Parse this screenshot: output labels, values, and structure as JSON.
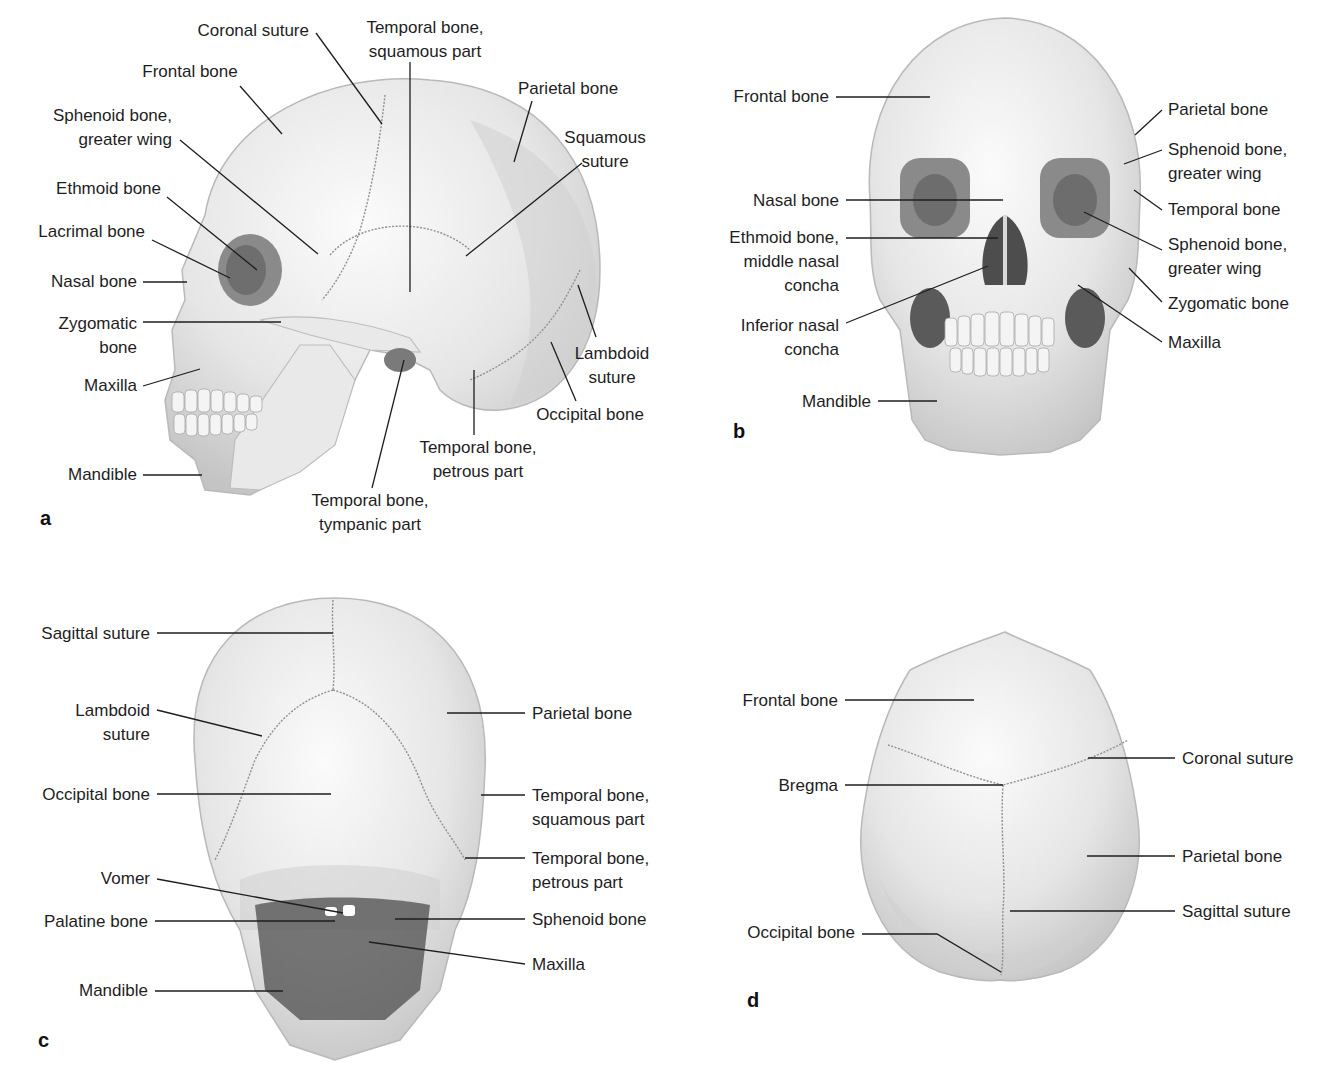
{
  "figure": {
    "panels": [
      {
        "id": "a",
        "letter": "a",
        "view": "lateral",
        "letter_pos": [
          40,
          525
        ],
        "labels": [
          {
            "text": [
              "Coronal suture"
            ],
            "x": 309,
            "y": 36,
            "anchor": "end",
            "line": [
              [
                316,
                33
              ],
              [
                382,
                124
              ]
            ]
          },
          {
            "text": [
              "Temporal bone,",
              "squamous part"
            ],
            "x": 425,
            "y": 33,
            "anchor": "middle",
            "line": [
              [
                410,
                62
              ],
              [
                410,
                292
              ]
            ]
          },
          {
            "text": [
              "Frontal bone"
            ],
            "x": 190,
            "y": 77,
            "anchor": "middle",
            "line": [
              [
                240,
                86
              ],
              [
                282,
                134
              ]
            ]
          },
          {
            "text": [
              "Parietal bone"
            ],
            "x": 568,
            "y": 94,
            "anchor": "middle",
            "line": [
              [
                532,
                101
              ],
              [
                514,
                162
              ]
            ]
          },
          {
            "text": [
              "Sphenoid bone,",
              "greater wing"
            ],
            "x": 172,
            "y": 121,
            "anchor": "end",
            "line": [
              [
                180,
                140
              ],
              [
                318,
                254
              ]
            ]
          },
          {
            "text": [
              "Squamous",
              "suture"
            ],
            "x": 605,
            "y": 143,
            "anchor": "middle",
            "line": [
              [
                582,
                163
              ],
              [
                466,
                256
              ]
            ]
          },
          {
            "text": [
              "Ethmoid bone"
            ],
            "x": 161,
            "y": 194,
            "anchor": "end",
            "line": [
              [
                167,
                197
              ],
              [
                257,
                270
              ]
            ]
          },
          {
            "text": [
              "Lacrimal bone"
            ],
            "x": 145,
            "y": 237,
            "anchor": "end",
            "line": [
              [
                152,
                240
              ],
              [
                230,
                278
              ]
            ]
          },
          {
            "text": [
              "Nasal bone"
            ],
            "x": 137,
            "y": 287,
            "anchor": "end",
            "line": [
              [
                143,
                282
              ],
              [
                187,
                282
              ]
            ]
          },
          {
            "text": [
              "Zygomatic",
              "bone"
            ],
            "x": 137,
            "y": 329,
            "anchor": "end",
            "line": [
              [
                143,
                322
              ],
              [
                281,
                322
              ]
            ]
          },
          {
            "text": [
              "Lambdoid",
              "suture"
            ],
            "x": 612,
            "y": 359,
            "anchor": "middle",
            "line": [
              [
                596,
                337
              ],
              [
                578,
                285
              ]
            ]
          },
          {
            "text": [
              "Maxilla"
            ],
            "x": 137,
            "y": 391,
            "anchor": "end",
            "line": [
              [
                143,
                386
              ],
              [
                200,
                369
              ]
            ]
          },
          {
            "text": [
              "Occipital bone"
            ],
            "x": 590,
            "y": 420,
            "anchor": "middle",
            "line": [
              [
                576,
                401
              ],
              [
                551,
                342
              ]
            ]
          },
          {
            "text": [
              "Temporal bone,",
              "petrous part"
            ],
            "x": 478,
            "y": 453,
            "anchor": "middle",
            "line": [
              [
                474,
                435
              ],
              [
                474,
                370
              ]
            ]
          },
          {
            "text": [
              "Mandible"
            ],
            "x": 137,
            "y": 480,
            "anchor": "end",
            "line": [
              [
                143,
                475
              ],
              [
                202,
                475
              ]
            ]
          },
          {
            "text": [
              "Temporal bone,",
              "tympanic part"
            ],
            "x": 370,
            "y": 506,
            "anchor": "middle",
            "line": [
              [
                372,
                488
              ],
              [
                404,
                360
              ]
            ]
          }
        ]
      },
      {
        "id": "b",
        "letter": "b",
        "view": "anterior",
        "letter_pos": [
          733,
          438
        ],
        "labels": [
          {
            "text": [
              "Frontal bone"
            ],
            "x": 829,
            "y": 102,
            "anchor": "end",
            "line": [
              [
                836,
                97
              ],
              [
                930,
                97
              ]
            ]
          },
          {
            "text": [
              "Parietal bone"
            ],
            "x": 1168,
            "y": 115,
            "anchor": "start",
            "line": [
              [
                1162,
                110
              ],
              [
                1135,
                135
              ]
            ]
          },
          {
            "text": [
              "Sphenoid bone,",
              "greater wing"
            ],
            "x": 1168,
            "y": 155,
            "anchor": "start",
            "line": [
              [
                1162,
                150
              ],
              [
                1124,
                164
              ]
            ]
          },
          {
            "text": [
              "Nasal bone"
            ],
            "x": 839,
            "y": 206,
            "anchor": "end",
            "line": [
              [
                846,
                200
              ],
              [
                1003,
                200
              ]
            ]
          },
          {
            "text": [
              "Temporal bone"
            ],
            "x": 1168,
            "y": 215,
            "anchor": "start",
            "line": [
              [
                1162,
                210
              ],
              [
                1134,
                190
              ]
            ]
          },
          {
            "text": [
              "Ethmoid bone,",
              "middle nasal",
              "concha"
            ],
            "x": 839,
            "y": 243,
            "anchor": "end",
            "line": [
              [
                846,
                238
              ],
              [
                998,
                238
              ]
            ]
          },
          {
            "text": [
              "Sphenoid bone,",
              "greater wing"
            ],
            "x": 1168,
            "y": 250,
            "anchor": "start",
            "line": [
              [
                1162,
                250
              ],
              [
                1084,
                212
              ]
            ]
          },
          {
            "text": [
              "Zygomatic bone"
            ],
            "x": 1168,
            "y": 309,
            "anchor": "start",
            "line": [
              [
                1162,
                302
              ],
              [
                1129,
                268
              ]
            ]
          },
          {
            "text": [
              "Inferior nasal",
              "concha"
            ],
            "x": 839,
            "y": 331,
            "anchor": "end",
            "line": [
              [
                846,
                323
              ],
              [
                988,
                266
              ]
            ]
          },
          {
            "text": [
              "Maxilla"
            ],
            "x": 1168,
            "y": 348,
            "anchor": "start",
            "line": [
              [
                1162,
                342
              ],
              [
                1078,
                285
              ]
            ]
          },
          {
            "text": [
              "Mandible"
            ],
            "x": 871,
            "y": 407,
            "anchor": "end",
            "line": [
              [
                878,
                401
              ],
              [
                937,
                401
              ]
            ]
          }
        ]
      },
      {
        "id": "c",
        "letter": "c",
        "view": "posterior",
        "letter_pos": [
          38,
          1047
        ],
        "labels": [
          {
            "text": [
              "Sagittal suture"
            ],
            "x": 150,
            "y": 639,
            "anchor": "end",
            "line": [
              [
                157,
                633
              ],
              [
                333,
                633
              ]
            ]
          },
          {
            "text": [
              "Lambdoid",
              "suture"
            ],
            "x": 150,
            "y": 716,
            "anchor": "end",
            "line": [
              [
                157,
                710
              ],
              [
                262,
                736
              ]
            ]
          },
          {
            "text": [
              "Parietal bone"
            ],
            "x": 532,
            "y": 719,
            "anchor": "start",
            "line": [
              [
                525,
                713
              ],
              [
                447,
                713
              ]
            ]
          },
          {
            "text": [
              "Occipital bone"
            ],
            "x": 150,
            "y": 800,
            "anchor": "end",
            "line": [
              [
                157,
                794
              ],
              [
                331,
                794
              ]
            ]
          },
          {
            "text": [
              "Temporal bone,",
              "squamous part"
            ],
            "x": 532,
            "y": 801,
            "anchor": "start",
            "line": [
              [
                525,
                795
              ],
              [
                481,
                795
              ]
            ]
          },
          {
            "text": [
              "Temporal bone,",
              "petrous part"
            ],
            "x": 532,
            "y": 864,
            "anchor": "start",
            "line": [
              [
                525,
                858
              ],
              [
                465,
                858
              ]
            ]
          },
          {
            "text": [
              "Vomer"
            ],
            "x": 150,
            "y": 884,
            "anchor": "end",
            "line": [
              [
                157,
                879
              ],
              [
                343,
                913
              ]
            ]
          },
          {
            "text": [
              "Palatine bone"
            ],
            "x": 148,
            "y": 927,
            "anchor": "end",
            "line": [
              [
                155,
                921
              ],
              [
                335,
                921
              ]
            ]
          },
          {
            "text": [
              "Sphenoid bone"
            ],
            "x": 532,
            "y": 925,
            "anchor": "start",
            "line": [
              [
                525,
                919
              ],
              [
                395,
                919
              ]
            ]
          },
          {
            "text": [
              "Maxilla"
            ],
            "x": 532,
            "y": 970,
            "anchor": "start",
            "line": [
              [
                525,
                964
              ],
              [
                369,
                942
              ]
            ]
          },
          {
            "text": [
              "Mandible"
            ],
            "x": 148,
            "y": 996,
            "anchor": "end",
            "line": [
              [
                155,
                991
              ],
              [
                283,
                991
              ]
            ]
          }
        ]
      },
      {
        "id": "d",
        "letter": "d",
        "view": "superior",
        "letter_pos": [
          747,
          1007
        ],
        "labels": [
          {
            "text": [
              "Frontal bone"
            ],
            "x": 838,
            "y": 706,
            "anchor": "end",
            "line": [
              [
                845,
                700
              ],
              [
                974,
                700
              ]
            ]
          },
          {
            "text": [
              "Coronal suture"
            ],
            "x": 1182,
            "y": 764,
            "anchor": "start",
            "line": [
              [
                1175,
                758
              ],
              [
                1088,
                758
              ]
            ]
          },
          {
            "text": [
              "Bregma"
            ],
            "x": 838,
            "y": 791,
            "anchor": "end",
            "line": [
              [
                845,
                785
              ],
              [
                1003,
                785
              ]
            ]
          },
          {
            "text": [
              "Parietal bone"
            ],
            "x": 1182,
            "y": 862,
            "anchor": "start",
            "line": [
              [
                1175,
                856
              ],
              [
                1087,
                856
              ]
            ]
          },
          {
            "text": [
              "Sagittal suture"
            ],
            "x": 1182,
            "y": 917,
            "anchor": "start",
            "line": [
              [
                1175,
                911
              ],
              [
                1010,
                911
              ]
            ]
          },
          {
            "text": [
              "Occipital bone"
            ],
            "x": 855,
            "y": 938,
            "anchor": "end",
            "line": [
              [
                862,
                934
              ],
              [
                937,
                934
              ],
              [
                1001,
                972
              ]
            ]
          }
        ]
      }
    ]
  }
}
